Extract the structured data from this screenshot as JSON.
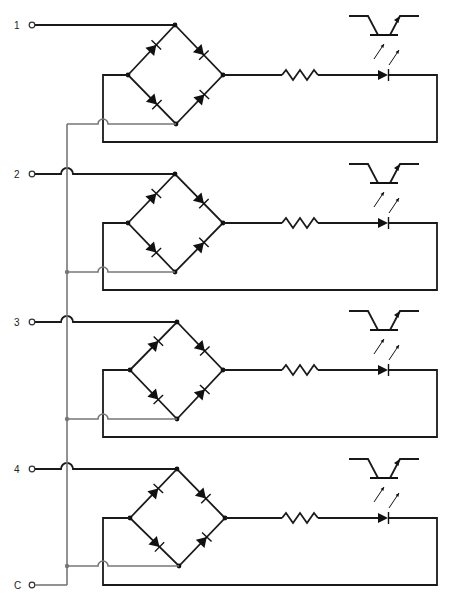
{
  "diagram": {
    "colors": {
      "wire": "#1a1a1a",
      "common_bus": "#777777",
      "background": "#ffffff"
    },
    "inputs": [
      {
        "label": "1",
        "y": 25
      },
      {
        "label": "2",
        "y": 174
      },
      {
        "label": "3",
        "y": 322
      },
      {
        "label": "4",
        "y": 469
      }
    ],
    "common": {
      "label": "C",
      "y": 585
    },
    "channels": [
      {
        "id": 1,
        "input_y": 25,
        "top": [
          175,
          25
        ],
        "left": [
          128,
          75
        ],
        "right": [
          223,
          75
        ],
        "bottom": [
          176,
          124
        ],
        "loop_bottom_y": 142,
        "hop": false
      },
      {
        "id": 2,
        "input_y": 174,
        "top": [
          175,
          174
        ],
        "left": [
          128,
          223
        ],
        "right": [
          223,
          223
        ],
        "bottom": [
          175,
          272
        ],
        "loop_bottom_y": 290,
        "hop": true
      },
      {
        "id": 3,
        "input_y": 322,
        "top": [
          177,
          322
        ],
        "left": [
          130,
          370
        ],
        "right": [
          223,
          370
        ],
        "bottom": [
          177,
          419
        ],
        "loop_bottom_y": 437,
        "hop": true
      },
      {
        "id": 4,
        "input_y": 469,
        "top": [
          177,
          469
        ],
        "left": [
          130,
          518
        ],
        "right": [
          225,
          518
        ],
        "bottom": [
          179,
          566
        ],
        "loop_bottom_y": 585,
        "hop": true
      }
    ],
    "components": {
      "bridge": "full-wave-bridge-rectifier (4 diodes)",
      "resistor": "series-current-limiting-resistor",
      "led": "infrared-emitting-diode",
      "detector": "phototransistor"
    }
  }
}
